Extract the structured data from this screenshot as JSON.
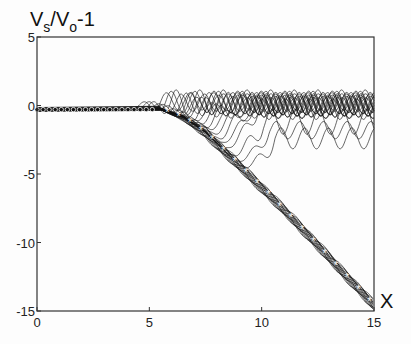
{
  "chart_data": {
    "type": "line",
    "title": "",
    "ylabel_main": "V",
    "ylabel_sub1": "s",
    "ylabel_mid": "/V",
    "ylabel_sub2": "o",
    "ylabel_tail": "-1",
    "xlabel": "X",
    "xlim": [
      0,
      15
    ],
    "ylim": [
      -15,
      5
    ],
    "xticks": [
      0,
      5,
      10,
      15
    ],
    "xtick_labels": [
      "0",
      "5",
      "10",
      "15"
    ],
    "yticks": [
      5,
      0,
      -5,
      -10,
      -15
    ],
    "ytick_labels": [
      "5",
      "0",
      "-5",
      "-10",
      "-15"
    ],
    "grid": false,
    "legend": null,
    "series": [
      {
        "name": "lower envelope (asterisk markers)",
        "marker": "asterisk",
        "x": [
          5.5,
          6.5,
          7.5,
          8.5,
          9.5,
          10.5,
          11.5,
          12.5,
          13.5,
          14.5,
          15
        ],
        "values": [
          -0.3,
          -0.9,
          -2.0,
          -3.6,
          -5.2,
          -6.8,
          -8.5,
          -10.2,
          -12.0,
          -13.7,
          -14.6
        ]
      },
      {
        "name": "initial flat segment (circle markers)",
        "marker": "circle",
        "x": [
          0,
          1,
          2,
          3,
          4,
          5
        ],
        "values": [
          -0.3,
          -0.3,
          -0.3,
          -0.3,
          -0.3,
          -0.3
        ]
      },
      {
        "name": "oscillating upper family",
        "description": "Family of ~20 curves branching off lower curve between x≈5.5 and x≈10, peaking near y≈1 and oscillating with amplitude ~1 around y≈0 to -2",
        "branch_x_range": [
          5.5,
          10.5
        ],
        "count": 20,
        "plateau_range": [
          0.8,
          -2.6
        ],
        "oscillation_amplitude": 0.9,
        "oscillation_period": 1.0
      }
    ]
  }
}
